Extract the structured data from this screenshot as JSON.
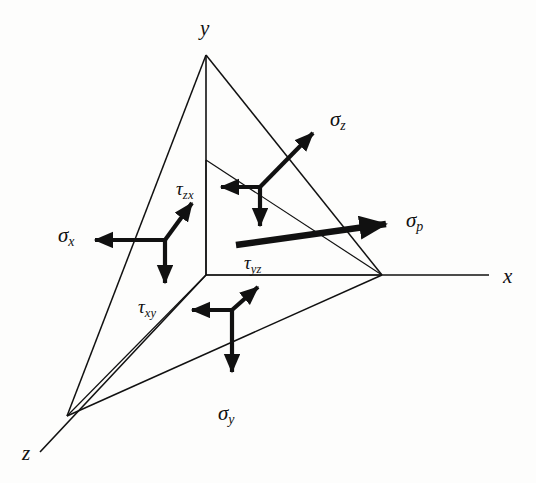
{
  "figure": {
    "type": "diagram",
    "background_color": "#fdfdfc",
    "stroke_color": "#111111"
  },
  "axes": [
    {
      "name": "x-axis",
      "label": "x",
      "label_x": 503,
      "label_y": 266,
      "from": [
        206,
        275
      ],
      "to": [
        489,
        275
      ]
    },
    {
      "name": "y-axis",
      "label": "y",
      "label_x": 200,
      "label_y": 18,
      "from": [
        206,
        275
      ],
      "to": [
        206,
        55
      ]
    },
    {
      "name": "z-axis",
      "label": "z",
      "label_x": 22,
      "label_y": 443,
      "from": [
        206,
        275
      ],
      "to": [
        40,
        452
      ]
    }
  ],
  "plane": {
    "name": "oblique-cut-plane",
    "vertices": {
      "y_vertex": [
        206,
        55
      ],
      "x_vertex": [
        382,
        275
      ],
      "z_vertex": [
        67,
        416
      ]
    }
  },
  "box_edges": {
    "vertical_edge": {
      "from": [
        206,
        275
      ],
      "to": [
        206,
        160
      ]
    },
    "horizontal_edge": {
      "from": [
        206,
        275
      ],
      "to": [
        340,
        275
      ]
    },
    "depth_edge": {
      "from": [
        206,
        275
      ],
      "to": [
        140,
        340
      ]
    }
  },
  "stress_triads": [
    {
      "name": "sigma-x-triad",
      "label": "σ",
      "subscript": "x",
      "label_x": 58,
      "label_y": 225,
      "junction": [
        165,
        240
      ],
      "arrows": [
        {
          "name": "sigma-x-normal-arrow",
          "to": [
            88,
            240
          ],
          "bold": true
        },
        {
          "name": "tau-zx-arrow",
          "to": [
            196,
            198
          ],
          "bold": true
        },
        {
          "name": "tau-xy-arrow",
          "to": [
            165,
            290
          ],
          "bold": true
        }
      ]
    },
    {
      "name": "sigma-z-triad",
      "label": "σ",
      "subscript": "z",
      "label_x": 330,
      "label_y": 109,
      "junction": [
        260,
        187
      ],
      "arrows": [
        {
          "name": "sigma-z-normal-arrow",
          "to": [
            318,
            128
          ],
          "bold": true
        },
        {
          "name": "tau-zx-horizontal-arrow",
          "to": [
            215,
            187
          ],
          "bold": true
        },
        {
          "name": "tau-zy-down-arrow",
          "to": [
            260,
            232
          ],
          "bold": true
        }
      ]
    },
    {
      "name": "sigma-y-triad",
      "label": "σ",
      "subscript": "y",
      "label_x": 218,
      "label_y": 403,
      "junction": [
        232,
        310
      ],
      "arrows": [
        {
          "name": "sigma-y-normal-arrow",
          "to": [
            232,
            378
          ],
          "bold": true
        },
        {
          "name": "tau-xy-horizontal-arrow",
          "to": [
            186,
            310
          ],
          "bold": true
        },
        {
          "name": "tau-yz-arrow",
          "to": [
            262,
            283
          ],
          "bold": true
        }
      ]
    },
    {
      "name": "sigma-p-resultant",
      "label": "σ",
      "subscript": "p",
      "label_x": 406,
      "label_y": 210,
      "from": [
        236,
        245
      ],
      "to": [
        392,
        224
      ],
      "bold": true
    }
  ],
  "shear_labels": [
    {
      "name": "tau-zx-label",
      "label": "τ",
      "subscript": "zx",
      "x": 176,
      "y": 179
    },
    {
      "name": "tau-xy-label",
      "label": "τ",
      "subscript": "xy",
      "x": 138,
      "y": 297
    },
    {
      "name": "tau-yz-label",
      "label": "τ",
      "subscript": "yz",
      "x": 244,
      "y": 253
    }
  ]
}
